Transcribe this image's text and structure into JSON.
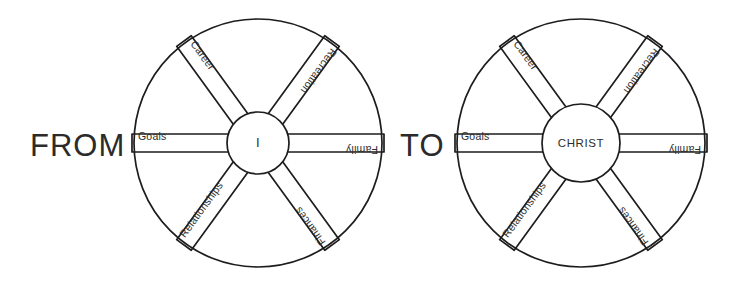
{
  "diagram": {
    "title_from": "FROM",
    "title_to": "TO",
    "wheels": [
      {
        "id": "self-centered-wheel",
        "hub_label": "I",
        "center_x": 258,
        "center_y": 143,
        "radius": 124,
        "hub_radius": 31,
        "spokes": [
          {
            "name": "goals",
            "label": "Goals",
            "angle": 180,
            "flip": false
          },
          {
            "name": "career",
            "label": "Career",
            "angle": 234,
            "flip": false
          },
          {
            "name": "recreation",
            "label": "Recreation",
            "angle": 306,
            "flip": true
          },
          {
            "name": "family",
            "label": "Family",
            "angle": 0,
            "flip": true
          },
          {
            "name": "finances",
            "label": "Finances",
            "angle": 54,
            "flip": true
          },
          {
            "name": "relationships",
            "label": "Relationships",
            "angle": 126,
            "flip": false
          }
        ]
      },
      {
        "id": "christ-centered-wheel",
        "hub_label": "CHRIST",
        "center_x": 581,
        "center_y": 143,
        "radius": 124,
        "hub_radius": 39,
        "spokes": [
          {
            "name": "goals",
            "label": "Goals",
            "angle": 180,
            "flip": false
          },
          {
            "name": "career",
            "label": "Career",
            "angle": 234,
            "flip": false
          },
          {
            "name": "recreation",
            "label": "Recreation",
            "angle": 306,
            "flip": true
          },
          {
            "name": "family",
            "label": "Family",
            "angle": 0,
            "flip": true
          },
          {
            "name": "finances",
            "label": "Finances",
            "angle": 54,
            "flip": true
          },
          {
            "name": "relationships",
            "label": "Relationships",
            "angle": 126,
            "flip": false
          }
        ]
      }
    ],
    "colors": {
      "ink": "#1d1d1d",
      "text": "#2b2b2b",
      "background": "#ffffff"
    }
  }
}
